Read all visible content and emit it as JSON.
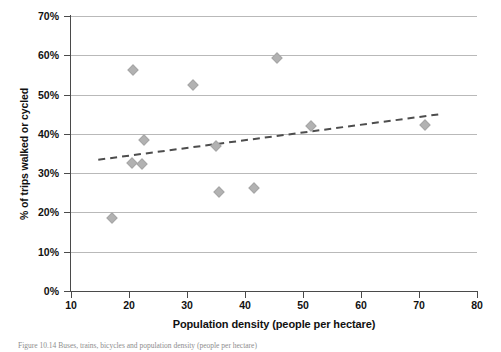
{
  "figure": {
    "caption": "Figure 10.14   Buses, trains, bicycles and population density (people per hectare)"
  },
  "chart_data": {
    "type": "scatter",
    "title": "",
    "xlabel": "Population density (people per hectare)",
    "ylabel": "% of trips walked or cycled",
    "xlim": [
      10,
      80
    ],
    "ylim": [
      0,
      70
    ],
    "xticks": [
      "10",
      "20",
      "30",
      "40",
      "50",
      "60",
      "70",
      "80"
    ],
    "yticks": [
      "0%",
      "10%",
      "20%",
      "30%",
      "40%",
      "50%",
      "60%",
      "70%"
    ],
    "xtick_values": [
      10,
      20,
      30,
      40,
      50,
      60,
      70,
      80
    ],
    "ytick_values": [
      0,
      10,
      20,
      30,
      40,
      50,
      60,
      70
    ],
    "grid": "horizontal",
    "legend": "none",
    "marker_shape": "diamond",
    "marker_color": "#b2b2b2",
    "points": [
      {
        "x": 17.0,
        "y": 18.7
      },
      {
        "x": 20.7,
        "y": 56.2
      },
      {
        "x": 20.5,
        "y": 32.5
      },
      {
        "x": 22.3,
        "y": 32.3
      },
      {
        "x": 22.5,
        "y": 38.5
      },
      {
        "x": 31.0,
        "y": 52.5
      },
      {
        "x": 35.0,
        "y": 36.8
      },
      {
        "x": 35.5,
        "y": 25.3
      },
      {
        "x": 41.5,
        "y": 26.2
      },
      {
        "x": 45.5,
        "y": 59.2
      },
      {
        "x": 51.3,
        "y": 42.0
      },
      {
        "x": 71.0,
        "y": 42.2
      }
    ],
    "trendline": {
      "style": "dashed",
      "color": "#4d4d4d",
      "x0": 14.7,
      "y0": 33.4,
      "x1": 73.6,
      "y1": 45.0
    }
  }
}
